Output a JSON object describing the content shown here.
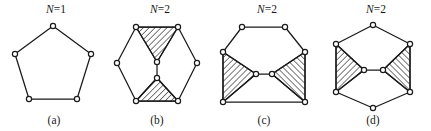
{
  "figure": {
    "background_color": "#ffffff",
    "line_color": "#1a1a1a",
    "vertex_fill": "#ffffff",
    "hatch_color": "#1a1a1a",
    "vertex_radius": 2.6
  },
  "panels": [
    {
      "id": "panel-a",
      "caption": "(a)",
      "n_prefix": "N",
      "n_equals": "=",
      "n_value": "1",
      "n_label": "N=1",
      "x": 0,
      "width": 105,
      "label_x": 56,
      "label_y": 13,
      "caption_x": 54,
      "caption_y": 124,
      "shape": "pentagon",
      "outline": [
        [
          53,
          26
        ],
        [
          91,
          54
        ],
        [
          77,
          99
        ],
        [
          29,
          99
        ],
        [
          15,
          54
        ]
      ],
      "inner_edges": [],
      "hatched_faces": [],
      "vertices": [
        [
          53,
          26
        ],
        [
          91,
          54
        ],
        [
          77,
          99
        ],
        [
          29,
          99
        ],
        [
          15,
          54
        ]
      ]
    },
    {
      "id": "panel-b",
      "caption": "(b)",
      "n_prefix": "N",
      "n_equals": "=",
      "n_value": "2",
      "n_label": "N=2",
      "x": 105,
      "width": 104,
      "label_x": 55,
      "label_y": 13,
      "caption_x": 52,
      "caption_y": 124,
      "shape": "hexagon-pointy-sides",
      "outline": [
        [
          31,
          27
        ],
        [
          73,
          27
        ],
        [
          92,
          63
        ],
        [
          73,
          101
        ],
        [
          31,
          101
        ],
        [
          12,
          63
        ]
      ],
      "inner_edges": [
        [
          [
            31,
            27
          ],
          [
            52,
            62
          ]
        ],
        [
          [
            73,
            27
          ],
          [
            52,
            62
          ]
        ],
        [
          [
            52,
            62
          ],
          [
            52,
            78
          ]
        ],
        [
          [
            31,
            101
          ],
          [
            52,
            78
          ]
        ],
        [
          [
            73,
            101
          ],
          [
            52,
            78
          ]
        ]
      ],
      "hatched_faces": [
        {
          "name": "upper-triangle",
          "points": [
            [
              31,
              27
            ],
            [
              73,
              27
            ],
            [
              52,
              62
            ]
          ],
          "hatch_angle": 45
        },
        {
          "name": "lower-triangle",
          "points": [
            [
              31,
              101
            ],
            [
              73,
              101
            ],
            [
              52,
              78
            ]
          ],
          "hatch_angle": 45
        }
      ],
      "vertices": [
        [
          31,
          27
        ],
        [
          73,
          27
        ],
        [
          92,
          63
        ],
        [
          73,
          101
        ],
        [
          31,
          101
        ],
        [
          12,
          63
        ],
        [
          52,
          62
        ],
        [
          52,
          78
        ]
      ]
    },
    {
      "id": "panel-c",
      "caption": "(c)",
      "n_prefix": "N",
      "n_equals": "=",
      "n_value": "2",
      "n_label": "N=2",
      "x": 209,
      "width": 110,
      "label_x": 58,
      "label_y": 13,
      "caption_x": 55,
      "caption_y": 124,
      "shape": "hexagon-flat-sides",
      "outline": [
        [
          33,
          27
        ],
        [
          76,
          27
        ],
        [
          96,
          52
        ],
        [
          96,
          102
        ],
        [
          14,
          102
        ],
        [
          14,
          52
        ]
      ],
      "inner_edges": [
        [
          [
            14,
            52
          ],
          [
            47,
            74
          ]
        ],
        [
          [
            14,
            102
          ],
          [
            47,
            74
          ]
        ],
        [
          [
            47,
            74
          ],
          [
            63,
            74
          ]
        ],
        [
          [
            96,
            52
          ],
          [
            63,
            74
          ]
        ],
        [
          [
            96,
            102
          ],
          [
            63,
            74
          ]
        ]
      ],
      "hatched_faces": [
        {
          "name": "left-triangle",
          "points": [
            [
              14,
              52
            ],
            [
              14,
              102
            ],
            [
              47,
              74
            ]
          ],
          "hatch_angle": 45
        },
        {
          "name": "right-triangle",
          "points": [
            [
              96,
              52
            ],
            [
              96,
              102
            ],
            [
              63,
              74
            ]
          ],
          "hatch_angle": -45
        }
      ],
      "vertices": [
        [
          33,
          27
        ],
        [
          76,
          27
        ],
        [
          96,
          52
        ],
        [
          96,
          102
        ],
        [
          14,
          102
        ],
        [
          14,
          52
        ],
        [
          47,
          74
        ],
        [
          63,
          74
        ]
      ]
    },
    {
      "id": "panel-d",
      "caption": "(d)",
      "n_prefix": "N",
      "n_equals": "=",
      "n_value": "2",
      "n_label": "N=2",
      "x": 319,
      "width": 112,
      "label_x": 57,
      "label_y": 13,
      "caption_x": 54,
      "caption_y": 124,
      "shape": "hexagon-pointy-topbottom",
      "outline": [
        [
          54,
          25
        ],
        [
          91,
          44
        ],
        [
          91,
          92
        ],
        [
          54,
          108
        ],
        [
          17,
          92
        ],
        [
          17,
          44
        ]
      ],
      "inner_edges": [
        [
          [
            17,
            44
          ],
          [
            45,
            70
          ]
        ],
        [
          [
            17,
            92
          ],
          [
            45,
            70
          ]
        ],
        [
          [
            45,
            70
          ],
          [
            64,
            70
          ]
        ],
        [
          [
            91,
            44
          ],
          [
            64,
            70
          ]
        ],
        [
          [
            91,
            92
          ],
          [
            64,
            70
          ]
        ]
      ],
      "hatched_faces": [
        {
          "name": "left-triangle",
          "points": [
            [
              17,
              44
            ],
            [
              17,
              92
            ],
            [
              45,
              70
            ]
          ],
          "hatch_angle": 45
        },
        {
          "name": "right-triangle",
          "points": [
            [
              91,
              44
            ],
            [
              91,
              92
            ],
            [
              64,
              70
            ]
          ],
          "hatch_angle": -45
        }
      ],
      "vertices": [
        [
          54,
          25
        ],
        [
          91,
          44
        ],
        [
          91,
          92
        ],
        [
          54,
          108
        ],
        [
          17,
          92
        ],
        [
          17,
          44
        ],
        [
          45,
          70
        ],
        [
          64,
          70
        ]
      ]
    }
  ]
}
